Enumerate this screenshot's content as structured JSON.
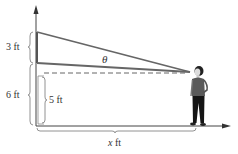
{
  "diagram": {
    "labels": {
      "upper_segment": "3 ft",
      "total_height": "6 ft",
      "lower_segment": "5 ft",
      "angle": "θ",
      "distance_var": "x",
      "distance_unit": " ft"
    },
    "colors": {
      "wall_line": "#555555",
      "axis": "#444444",
      "dashed": "#666666",
      "person_shirt": "#555555",
      "person_pants": "#111111",
      "brace": "#777777"
    }
  }
}
